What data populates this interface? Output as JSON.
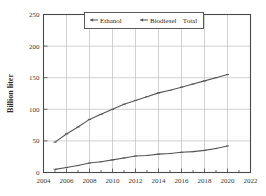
{
  "chart_data": {
    "type": "line",
    "title": "",
    "xlabel": "",
    "ylabel": "Billion liter",
    "xlim": [
      2004,
      2022
    ],
    "ylim": [
      0,
      250
    ],
    "xticks": [
      "2004",
      "2006",
      "2008",
      "2010",
      "2012",
      "2014",
      "2016",
      "2018",
      "2020",
      "2022"
    ],
    "yticks": [
      "0",
      "50",
      "100",
      "150",
      "200",
      "250"
    ],
    "grid": true,
    "legend_position": "top-center",
    "legend": [
      "Ethanol",
      "Biodiesel",
      "Total"
    ],
    "x": [
      2005,
      2006,
      2007,
      2008,
      2009,
      2010,
      2011,
      2012,
      2013,
      2014,
      2015,
      2016,
      2017,
      2018,
      2019,
      2020
    ],
    "series": [
      {
        "name": "Total",
        "values": [
          48,
          61,
          72,
          84,
          92,
          100,
          108,
          114,
          120,
          126,
          130,
          135,
          140,
          145,
          150,
          155
        ]
      },
      {
        "name": "Biodiesel",
        "values": [
          5,
          8,
          11,
          15,
          17,
          20,
          23,
          26,
          27,
          29,
          30,
          32,
          33,
          35,
          38,
          42
        ]
      }
    ]
  },
  "axes": {
    "ylabel": "Billion liter"
  },
  "legend": {
    "items": [
      {
        "label": "Ethanol",
        "marker": "line-marker"
      },
      {
        "label": "Biodiesel",
        "marker": "line-marker"
      },
      {
        "label": "Total",
        "marker": "none"
      }
    ]
  },
  "colors": {
    "line": "#555555",
    "grid": "#bfbfbf",
    "frame": "#4a4a4a",
    "text": "#2b2b2b"
  }
}
